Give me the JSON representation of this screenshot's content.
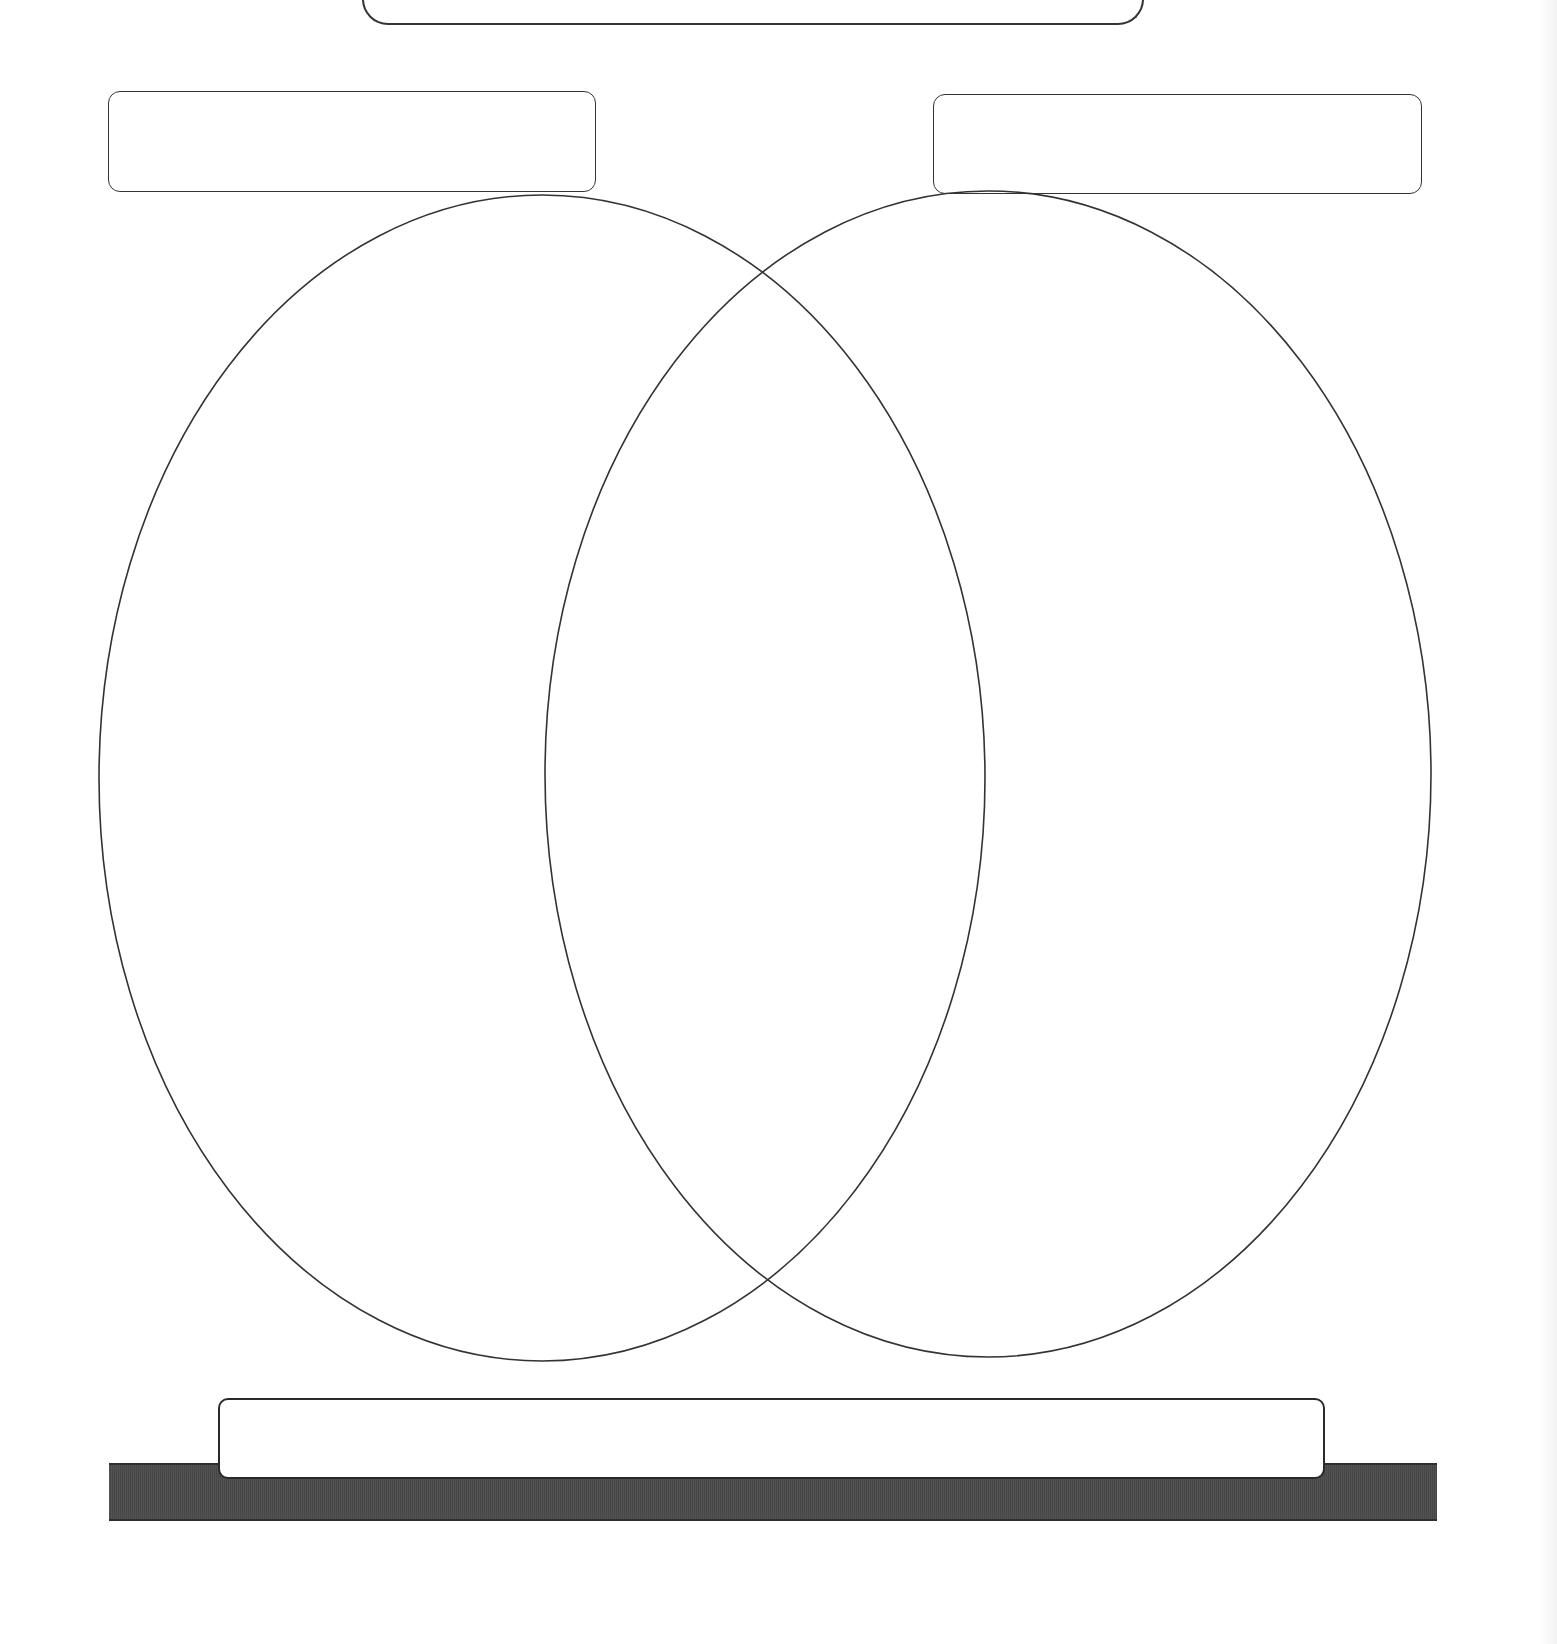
{
  "diagram": {
    "type": "venn",
    "title_box": {
      "text": ""
    },
    "set_a": {
      "label": "",
      "region_text": ""
    },
    "set_b": {
      "label": "",
      "region_text": ""
    },
    "intersection": {
      "region_text": ""
    },
    "bottom_box": {
      "text": ""
    },
    "colors": {
      "stroke": "#333333",
      "background": "#ffffff",
      "base_bar": "#4a4a4a"
    },
    "ellipses": [
      {
        "name": "set-a",
        "cx": 542,
        "cy": 778,
        "rx": 443,
        "ry": 583
      },
      {
        "name": "set-b",
        "cx": 988,
        "cy": 774,
        "rx": 443,
        "ry": 583
      }
    ]
  }
}
